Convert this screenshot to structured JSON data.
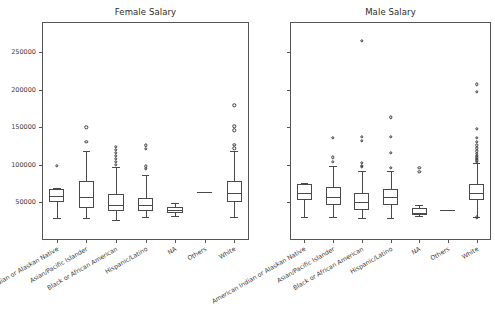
{
  "figure": {
    "width": 495,
    "height": 320,
    "background": "#ffffff",
    "line_color": "#4a4a4a",
    "text_color": "#3a3a3a"
  },
  "chart_data": [
    {
      "type": "box",
      "title": "Female Salary",
      "xlabel": "",
      "ylabel": "",
      "ylim": [
        0,
        290000
      ],
      "grid": false,
      "legend": null,
      "yticks": [
        50000,
        100000,
        150000,
        200000,
        250000
      ],
      "ytick_labels": [
        "50000",
        "100000",
        "150000",
        "200000",
        "250000"
      ],
      "ytick_labels_visible": true,
      "categories": [
        "American Indian or Alaskan Native",
        "Asian/Pacific Islander",
        "Black or African American",
        "Hispanic/Latino",
        "NA",
        "Others",
        "White"
      ],
      "boxes": [
        {
          "category": "American Indian or Alaskan Native",
          "whisker_low": 29000,
          "q1": 50000,
          "median": 58000,
          "q3": 68000,
          "whisker_high": 69000,
          "fliers": [
            99000
          ]
        },
        {
          "category": "Asian/Pacific Islander",
          "whisker_low": 29000,
          "q1": 42000,
          "median": 57000,
          "q3": 78000,
          "whisker_high": 118000,
          "fliers": [
            131000,
            150000
          ]
        },
        {
          "category": "Black or African American",
          "whisker_low": 27000,
          "q1": 38000,
          "median": 47000,
          "q3": 61000,
          "whisker_high": 97000,
          "fliers": [
            100000,
            104000,
            108000,
            112000,
            116000,
            120000,
            124000
          ]
        },
        {
          "category": "Hispanic/Latino",
          "whisker_low": 30000,
          "q1": 38000,
          "median": 46000,
          "q3": 56000,
          "whisker_high": 86000,
          "fliers": [
            95000,
            98000,
            121000,
            126000
          ]
        },
        {
          "category": "NA",
          "whisker_low": 32000,
          "q1": 36000,
          "median": 40000,
          "q3": 44000,
          "whisker_high": 49000,
          "fliers": []
        },
        {
          "category": "Others",
          "whisker_low": 64000,
          "q1": 64000,
          "median": 64000,
          "q3": 64000,
          "whisker_high": 64000,
          "fliers": []
        },
        {
          "category": "White",
          "whisker_low": 31000,
          "q1": 50000,
          "median": 63000,
          "q3": 79000,
          "whisker_high": 118000,
          "fliers": [
            122000,
            127000,
            146000,
            151000,
            179000
          ]
        }
      ]
    },
    {
      "type": "box",
      "title": "Male Salary",
      "xlabel": "",
      "ylabel": "",
      "ylim": [
        0,
        290000
      ],
      "grid": false,
      "legend": null,
      "yticks": [
        50000,
        100000,
        150000,
        200000,
        250000
      ],
      "ytick_labels": [],
      "ytick_labels_visible": false,
      "categories": [
        "American Indian or Alaskan Native",
        "Asian/Pacific Islander",
        "Black or African American",
        "Hispanic/Latino",
        "NA",
        "Others",
        "White"
      ],
      "boxes": [
        {
          "category": "American Indian or Alaskan Native",
          "whisker_low": 30000,
          "q1": 53000,
          "median": 62000,
          "q3": 74000,
          "whisker_high": 76000,
          "fliers": []
        },
        {
          "category": "Asian/Pacific Islander",
          "whisker_low": 30000,
          "q1": 47000,
          "median": 57000,
          "q3": 71000,
          "whisker_high": 99000,
          "fliers": [
            104000,
            110000,
            136000
          ]
        },
        {
          "category": "Black or African American",
          "whisker_low": 29000,
          "q1": 40000,
          "median": 50000,
          "q3": 62000,
          "whisker_high": 92000,
          "fliers": [
            97000,
            99000,
            103000,
            132000,
            137000,
            265000
          ]
        },
        {
          "category": "Hispanic/Latino",
          "whisker_low": 29000,
          "q1": 47000,
          "median": 57000,
          "q3": 68000,
          "whisker_high": 92000,
          "fliers": [
            96000,
            116000,
            137000,
            163000
          ]
        },
        {
          "category": "NA",
          "whisker_low": 32000,
          "q1": 34000,
          "median": 35000,
          "q3": 42000,
          "whisker_high": 47000,
          "fliers": [
            91000,
            96000
          ]
        },
        {
          "category": "Others",
          "whisker_low": 40000,
          "q1": 40000,
          "median": 40000,
          "q3": 40000,
          "whisker_high": 40000,
          "fliers": []
        },
        {
          "category": "White",
          "whisker_low": 31000,
          "q1": 53000,
          "median": 63000,
          "q3": 75000,
          "whisker_high": 103000,
          "fliers": [
            30000,
            104000,
            106000,
            108000,
            110000,
            112000,
            115000,
            118000,
            122000,
            126000,
            131000,
            136000,
            148000,
            197000,
            207000
          ]
        }
      ]
    }
  ]
}
